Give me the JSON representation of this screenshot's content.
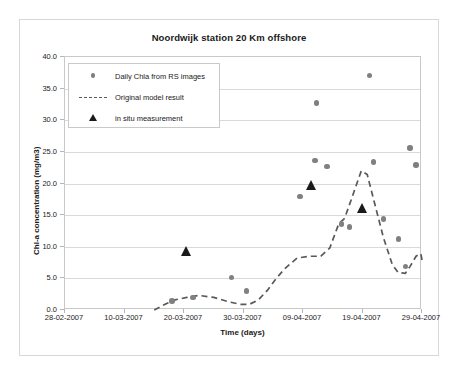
{
  "figure": {
    "title": "Noordwijk station 20 Km offshore"
  },
  "legend": {
    "position": "top-left-inside",
    "items": [
      {
        "label": "Daily Chla from RS images",
        "symbol": "circle-marker",
        "color": "#7f7f7f"
      },
      {
        "label": "Original model result",
        "symbol": "dashed-line",
        "color": "#595959"
      },
      {
        "label": "in situ measurement",
        "symbol": "triangle-marker",
        "color": "#1a1a1a"
      }
    ]
  },
  "chart_data": {
    "type": "scatter",
    "title": "Noordwijk station 20 Km offshore",
    "xlabel": "Time (days)",
    "ylabel": "Chl-a concentration (mg/m3)",
    "ylim": [
      0.0,
      40.0
    ],
    "yticks": [
      "0.0",
      "5.0",
      "10.0",
      "15.0",
      "20.0",
      "25.0",
      "30.0",
      "35.0",
      "40.0"
    ],
    "ytick_values": [
      0.0,
      5.0,
      10.0,
      15.0,
      20.0,
      25.0,
      30.0,
      35.0,
      40.0
    ],
    "xticks": [
      "28-02-2007",
      "10-03-2007",
      "20-03-2007",
      "30-03-2007",
      "09-04-2007",
      "19-04-2007",
      "29-04-2007"
    ],
    "xtick_days": [
      0,
      10,
      20,
      30,
      40,
      50,
      60
    ],
    "xlim_days": [
      0,
      60
    ],
    "grid": "horizontal",
    "series": [
      {
        "name": "Daily Chla from RS images",
        "type": "scatter",
        "marker": "circle",
        "color": "#808080",
        "points": [
          {
            "day": 18.0,
            "value": 1.4
          },
          {
            "day": 21.5,
            "value": 2.0
          },
          {
            "day": 28.0,
            "value": 5.1
          },
          {
            "day": 30.5,
            "value": 3.0
          },
          {
            "day": 39.5,
            "value": 17.9
          },
          {
            "day": 42.0,
            "value": 23.6
          },
          {
            "day": 42.3,
            "value": 32.7
          },
          {
            "day": 44.0,
            "value": 22.7
          },
          {
            "day": 46.5,
            "value": 13.6
          },
          {
            "day": 47.8,
            "value": 13.1
          },
          {
            "day": 51.2,
            "value": 37.1
          },
          {
            "day": 51.8,
            "value": 23.4
          },
          {
            "day": 53.5,
            "value": 14.4
          },
          {
            "day": 56.0,
            "value": 11.2
          },
          {
            "day": 57.2,
            "value": 6.9
          },
          {
            "day": 58.0,
            "value": 25.6
          },
          {
            "day": 59.0,
            "value": 22.9
          }
        ]
      },
      {
        "name": "Original model result",
        "type": "line",
        "style": "dashed",
        "color": "#595959",
        "points": [
          {
            "day": 15.0,
            "value": 0.0
          },
          {
            "day": 17.0,
            "value": 1.0
          },
          {
            "day": 18.5,
            "value": 1.6
          },
          {
            "day": 20.5,
            "value": 2.0
          },
          {
            "day": 22.5,
            "value": 2.3
          },
          {
            "day": 25.0,
            "value": 2.0
          },
          {
            "day": 27.5,
            "value": 1.3
          },
          {
            "day": 29.5,
            "value": 0.9
          },
          {
            "day": 31.0,
            "value": 0.9
          },
          {
            "day": 32.5,
            "value": 1.6
          },
          {
            "day": 34.0,
            "value": 3.1
          },
          {
            "day": 35.5,
            "value": 5.0
          },
          {
            "day": 37.0,
            "value": 6.6
          },
          {
            "day": 39.0,
            "value": 8.2
          },
          {
            "day": 41.0,
            "value": 8.5
          },
          {
            "day": 43.0,
            "value": 8.5
          },
          {
            "day": 44.5,
            "value": 9.8
          },
          {
            "day": 46.0,
            "value": 13.6
          },
          {
            "day": 47.0,
            "value": 14.5
          },
          {
            "day": 48.5,
            "value": 18.5
          },
          {
            "day": 49.8,
            "value": 22.0
          },
          {
            "day": 50.8,
            "value": 21.4
          },
          {
            "day": 52.0,
            "value": 17.0
          },
          {
            "day": 53.5,
            "value": 11.5
          },
          {
            "day": 55.0,
            "value": 7.2
          },
          {
            "day": 56.0,
            "value": 5.9
          },
          {
            "day": 57.2,
            "value": 5.8
          },
          {
            "day": 58.0,
            "value": 6.9
          },
          {
            "day": 59.0,
            "value": 8.5
          },
          {
            "day": 59.8,
            "value": 8.9
          },
          {
            "day": 60.0,
            "value": 7.9
          }
        ]
      },
      {
        "name": "in situ measurement",
        "type": "scatter",
        "marker": "triangle",
        "color": "#1a1a1a",
        "points": [
          {
            "day": 20.5,
            "value": 9.4
          },
          {
            "day": 41.5,
            "value": 19.8
          },
          {
            "day": 50.0,
            "value": 16.2
          }
        ]
      }
    ]
  }
}
